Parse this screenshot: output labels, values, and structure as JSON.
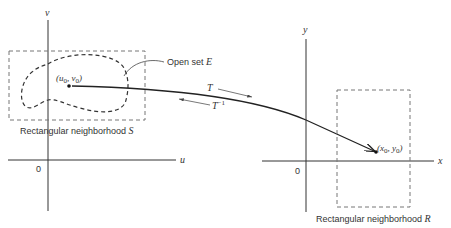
{
  "diagram": {
    "left_plane": {
      "horizontal_axis_label": "u",
      "vertical_axis_label": "v",
      "origin_label": "0",
      "region_label": "Rectangular neighborhood",
      "region_symbol": "S",
      "set_label": "Open set",
      "set_symbol": "E",
      "point_label": "(u",
      "point_sub1": "0",
      "point_mid": ", v",
      "point_sub2": "0",
      "point_end": ")"
    },
    "right_plane": {
      "horizontal_axis_label": "x",
      "vertical_axis_label": "y",
      "origin_label": "0",
      "region_label": "Rectangular neighborhood",
      "region_symbol": "R",
      "point_label": "(x",
      "point_sub1": "0",
      "point_mid": ", y",
      "point_sub2": "0",
      "point_end": ")"
    },
    "mapping": {
      "forward_label": "T",
      "inverse_label": "T",
      "inverse_sup": "−1"
    },
    "colors": {
      "ink": "#222222",
      "dashed": "#777777"
    }
  }
}
